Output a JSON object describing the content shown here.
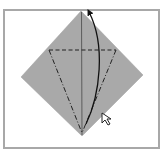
{
  "diagram": {
    "type": "origami-fold-step",
    "frame_color": "#a8a8a8",
    "paper_color": "#a9a9a9",
    "line_color": "#1a1a1a",
    "elements": {
      "paper": {
        "shape": "diamond",
        "points": [
          [
            81,
            11
          ],
          [
            143,
            75
          ],
          [
            82,
            136
          ],
          [
            21,
            77
          ]
        ]
      },
      "center_crease": {
        "style": "solid-thin",
        "from": [
          81,
          11
        ],
        "to": [
          82,
          136
        ]
      },
      "valley_fold_line": {
        "style": "dashed",
        "from": [
          49,
          50
        ],
        "to": [
          116,
          50
        ]
      },
      "mountain_fold_left": {
        "style": "dash-dot",
        "from": [
          49,
          50
        ],
        "to": [
          82,
          133
        ]
      },
      "mountain_fold_right": {
        "style": "dash-dot",
        "from": [
          116,
          50
        ],
        "to": [
          82,
          133
        ]
      },
      "fold_arrow": {
        "style": "curved-arrow",
        "direction": "up",
        "from": [
          86,
          125
        ],
        "to": [
          88,
          10
        ]
      },
      "pointer_cursor": {
        "icon": "cursor-arrow",
        "position": [
          103,
          114
        ]
      }
    }
  }
}
